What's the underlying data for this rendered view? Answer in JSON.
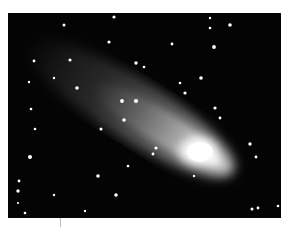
{
  "image": {
    "subject": "Comet with a glowing nucleus and long diffuse tail against a star field",
    "background_color": "#040404",
    "frame_color": "#ffffff"
  }
}
